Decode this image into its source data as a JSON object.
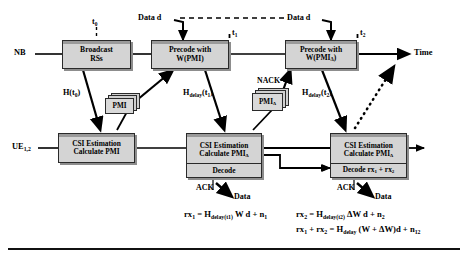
{
  "figure": {
    "bottom_rule": true
  },
  "colors": {
    "box_fill": "#d4d4d4",
    "box_border": "#2a2a2a",
    "box_shadow": "#8d8d8d",
    "line": "#000000",
    "background": "#ffffff"
  },
  "actors": {
    "nb": "NB",
    "ue": "UE",
    "ue_sub": "1,2"
  },
  "axis": {
    "time_label": "Time",
    "markers": [
      {
        "name": "t0",
        "label": "t",
        "sub": "0"
      },
      {
        "name": "t1",
        "label": "t",
        "sub": "1"
      },
      {
        "name": "t2",
        "label": "t",
        "sub": "2"
      }
    ]
  },
  "nb_boxes": [
    {
      "name": "broadcast-rss",
      "lines": [
        "Broadcast",
        "RSs"
      ]
    },
    {
      "name": "precode-w-pmi",
      "lines": [
        "Precode with",
        "W(PMI)"
      ]
    },
    {
      "name": "precode-w-pmi-delta",
      "lines": [
        "Precode with",
        "W(PMIΔ)"
      ],
      "line2_base": "W(PMI",
      "line2_sub": "Δ",
      "line2_tail": ")"
    }
  ],
  "ue_boxes": [
    {
      "name": "csi-estimation-calculate-pmi",
      "lines": [
        "CSI Estimation",
        "Calculate PMI"
      ],
      "second_cell": null
    },
    {
      "name": "csi-estimation-calculate-pmi-delta",
      "lines": [
        "CSI Estimation",
        "Calculate PMIΔ"
      ],
      "line2_base": "Calculate PMI",
      "line2_sub": "Δ",
      "second_cell": "Decode"
    },
    {
      "name": "csi-estimation-calculate-pmi-delta-2",
      "lines": [
        "CSI Estimation",
        "Calculate PMIΔ"
      ],
      "line2_base": "Calculate PMI",
      "line2_sub": "Δ",
      "second_cell": "Decode rx1 + rx2",
      "second_cell_parts": {
        "pre": "Decode rx",
        "sub1": "1",
        "mid": " + rx",
        "sub2": "2"
      }
    }
  ],
  "feedback_cards": [
    {
      "name": "pmi-card",
      "label": "PMI"
    },
    {
      "name": "pmi-delta-card",
      "label": "PMI",
      "sub": "Δ"
    }
  ],
  "labels": {
    "data_d_left": "Data d",
    "data_d_right": "Data d",
    "h_t0": {
      "base": "H(t",
      "sub": "0",
      "tail": ")"
    },
    "h_delay_t1": {
      "base": "H",
      "sub": "delay",
      "tail": "(t",
      "sub2": "1",
      "tail2": ")"
    },
    "h_delay_t2": {
      "base": "H",
      "sub": "delay",
      "tail": "(t",
      "sub2": "2",
      "tail2": ")"
    },
    "nack": "NACK",
    "ack_left": "ACK",
    "ack_right": "ACK",
    "data_left": "Data",
    "data_right": "Data"
  },
  "equations": [
    {
      "name": "equation-rx1",
      "parts": [
        {
          "t": "rx"
        },
        {
          "s": "1"
        },
        {
          "t": " = H"
        },
        {
          "s": "delay(t1)"
        },
        {
          "t": " W d + n"
        },
        {
          "s": "1"
        }
      ]
    },
    {
      "name": "equation-rx2",
      "parts": [
        {
          "t": "rx"
        },
        {
          "s": "2"
        },
        {
          "t": " = H"
        },
        {
          "s": "delay(t2)"
        },
        {
          "t": " ΔW d + n"
        },
        {
          "s": "2"
        }
      ]
    },
    {
      "name": "equation-rx1-plus-rx2",
      "parts": [
        {
          "t": "rx"
        },
        {
          "s": "1"
        },
        {
          "t": " + rx"
        },
        {
          "s": "2"
        },
        {
          "t": " = H"
        },
        {
          "s": "delay"
        },
        {
          "t": " (W + ΔW)d + n"
        },
        {
          "s": "12"
        }
      ]
    }
  ]
}
